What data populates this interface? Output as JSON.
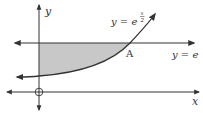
{
  "diagram": {
    "title": "",
    "axes": {
      "x_label": "x",
      "y_label": "y",
      "origin_marker": "circle"
    },
    "curve": {
      "label_base": "y = e",
      "label_exponent_num": "x",
      "label_exponent_den": "2",
      "equation": "y = e^(x/2)"
    },
    "line": {
      "label": "y = e",
      "equation": "y = e"
    },
    "point": {
      "label": "A",
      "description": "intersection of y = e^(x/2) and y = e"
    },
    "shaded_region": {
      "description": "region bounded by y-axis, y = e, and y = e^(x/2)",
      "fill": "#c8c8c8"
    },
    "colors": {
      "stroke": "#333333",
      "shade": "#c8c8c8",
      "background": "#ffffff"
    }
  }
}
